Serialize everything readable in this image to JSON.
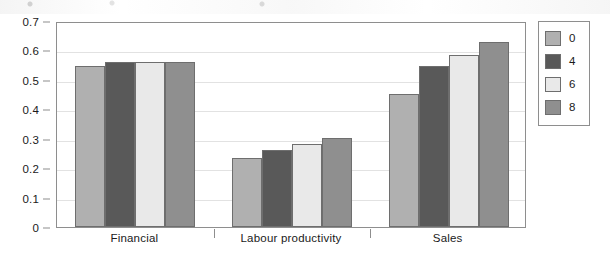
{
  "chart_data": {
    "type": "bar",
    "title": "",
    "subtitle": "",
    "xlabel": "",
    "ylabel": "",
    "categories": [
      "Financial",
      "Labour productivity",
      "Sales"
    ],
    "series": [
      {
        "name": "0",
        "color": "#b0b0b0",
        "values": [
          0.548,
          0.234,
          0.453
        ]
      },
      {
        "name": "4",
        "color": "#595959",
        "values": [
          0.56,
          0.262,
          0.547
        ]
      },
      {
        "name": "6",
        "color": "#e9e9e9",
        "values": [
          0.56,
          0.282,
          0.585
        ]
      },
      {
        "name": "8",
        "color": "#8f8f8f",
        "values": [
          0.56,
          0.304,
          0.627
        ]
      }
    ],
    "ylim": [
      0,
      0.7
    ],
    "ytick_step": 0.1,
    "ytick_labels": [
      "0",
      "0.1",
      "0.2",
      "0.3",
      "0.4",
      "0.5",
      "0.6",
      "0.7"
    ],
    "grid": true,
    "grid_axis": "y",
    "legend_position": "right",
    "legend_entries": [
      "0",
      "4",
      "6",
      "8"
    ],
    "bar_outline_color": "#6e6e6e",
    "axis_color": "#8e8e8e",
    "gridline_color": "#e2e2e2",
    "background_color": "#ffffff",
    "text_color": "#1a1a1a"
  }
}
